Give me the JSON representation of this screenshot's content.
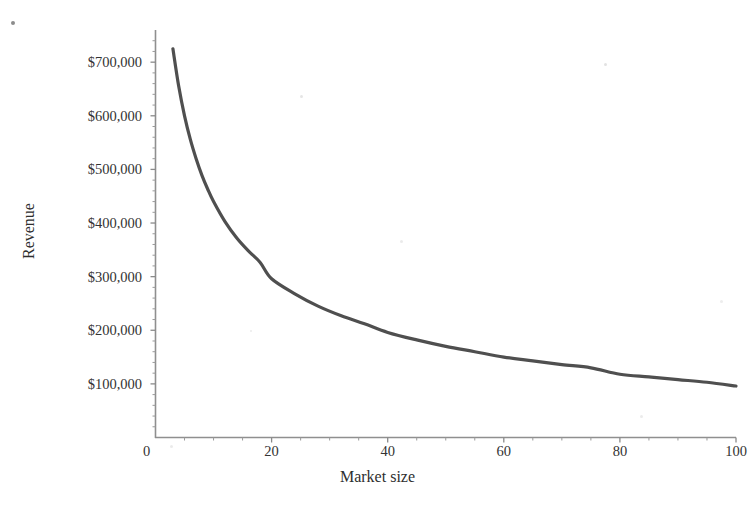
{
  "chart_data": {
    "type": "line",
    "title": "",
    "subtitle": "",
    "xlabel": "Market size",
    "ylabel": "Revenue",
    "xlim": [
      0,
      100
    ],
    "ylim": [
      0,
      760000
    ],
    "xticks": [
      0,
      20,
      40,
      60,
      80,
      100
    ],
    "xticklabels": [
      "0",
      "20",
      "40",
      "60",
      "80",
      "100"
    ],
    "yticks": [
      100000,
      200000,
      300000,
      400000,
      500000,
      600000,
      700000
    ],
    "yticklabels": [
      "$100,000",
      "$200,000",
      "$300,000",
      "$400,000",
      "$500,000",
      "$600,000",
      "$700,000"
    ],
    "grid": false,
    "legend": null,
    "minor_ticks": {
      "x": true,
      "y": true
    },
    "series": [
      {
        "name": "Revenue",
        "color": "#4f4f4f",
        "linewidth": 3,
        "x": [
          3,
          4,
          5,
          6,
          7,
          8,
          9,
          10,
          12,
          14,
          16,
          18,
          20,
          24,
          28,
          32,
          36,
          40,
          45,
          50,
          55,
          60,
          65,
          70,
          75,
          80,
          85,
          90,
          95,
          100
        ],
        "y": [
          725000,
          655000,
          600000,
          556000,
          520000,
          489000,
          463000,
          440000,
          402000,
          372000,
          348000,
          327000,
          296000,
          268000,
          245000,
          227000,
          212000,
          196000,
          182000,
          170000,
          160000,
          150000,
          143000,
          136000,
          130000,
          118000,
          113000,
          108000,
          103000,
          96000
        ]
      }
    ]
  },
  "axes": {
    "y_title": "Revenue",
    "x_title": "Market size"
  },
  "colors": {
    "curve": "#4f4f4f",
    "axis": "#8a8a8a",
    "text": "#333333",
    "background": "#ffffff"
  }
}
